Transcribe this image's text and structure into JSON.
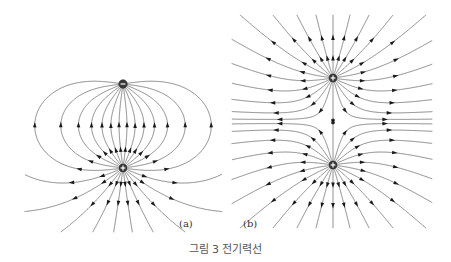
{
  "figure": {
    "caption": "그림 3 전기력선",
    "panels": [
      {
        "label": "(a)",
        "description": "Electric field lines of a dipole (opposite charges)",
        "charges": [
          {
            "sign": "-",
            "symbol": "−",
            "x": 123,
            "y": 84
          },
          {
            "sign": "+",
            "symbol": "+",
            "x": 123,
            "y": 168
          }
        ]
      },
      {
        "label": "(b)",
        "description": "Electric field lines of two like (positive) charges",
        "charges": [
          {
            "sign": "+",
            "symbol": "+",
            "x": 333,
            "y": 78
          },
          {
            "sign": "+",
            "symbol": "+",
            "x": 333,
            "y": 165
          }
        ]
      }
    ],
    "colors": {
      "field_line": "#6a6a6a",
      "arrow": "#1a1a1a",
      "charge": "#3a3a3a",
      "caption": "#555555"
    }
  }
}
